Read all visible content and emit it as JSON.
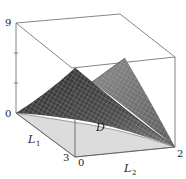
{
  "figure": {
    "type": "3d-surface-plot",
    "axes": {
      "z": {
        "min_label": "0",
        "max_label": "9"
      },
      "L1": {
        "name": "L",
        "subscript": "1",
        "start_label": "0",
        "end_label": "3"
      },
      "L2": {
        "name": "L",
        "subscript": "2",
        "start_label": "0",
        "end_label": "2"
      }
    },
    "region_label": "D",
    "colors": {
      "box": "#555555",
      "surface_dark": "#3a3a3a",
      "surface_mid": "#6a6a6a",
      "surface_light": "#9a9a9a",
      "grid": "#c8c8c8",
      "domain": "#d9d9d9",
      "background": "#ffffff"
    }
  }
}
